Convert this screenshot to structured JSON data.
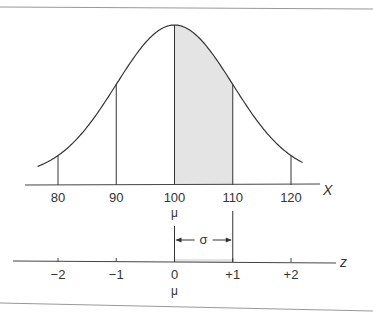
{
  "chart_data": {
    "type": "area",
    "title": "",
    "distribution": {
      "mean": 100,
      "sd": 10
    },
    "x_axis": {
      "label": "X",
      "ticks": [
        80,
        90,
        100,
        110,
        120
      ],
      "tick_labels": [
        "80",
        "90",
        "100",
        "110",
        "120"
      ],
      "range": [
        76,
        123
      ]
    },
    "z_axis": {
      "label": "z",
      "ticks": [
        -2,
        -1,
        0,
        1,
        2
      ],
      "tick_labels": [
        "−2",
        "−1",
        "0",
        "+1",
        "+2"
      ],
      "range": [
        -2.7,
        2.85
      ]
    },
    "shaded_region": {
      "from": 100,
      "to": 110,
      "color": "#e4e4e4"
    },
    "mean_symbol": "μ",
    "sigma_symbol": "σ",
    "annotations": [
      {
        "text": "μ",
        "under": "100"
      },
      {
        "text": "μ",
        "under": "0"
      },
      {
        "text": "σ",
        "meaning": "distance from 0 to +1 equals one standard deviation"
      }
    ]
  }
}
